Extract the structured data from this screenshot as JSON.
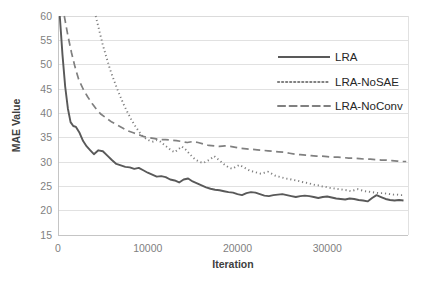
{
  "chart_data": {
    "type": "line",
    "title": "",
    "xlabel": "Iteration",
    "ylabel": "MAE Value",
    "xlim": [
      0,
      39000
    ],
    "ylim": [
      15,
      60
    ],
    "xticks": [
      0,
      10000,
      20000,
      30000
    ],
    "xtick_labels": [
      "0",
      "10000",
      "20000",
      "30000"
    ],
    "yticks": [
      15,
      20,
      25,
      30,
      35,
      40,
      45,
      50,
      55,
      60
    ],
    "ytick_labels": [
      "15",
      "20",
      "25",
      "30",
      "35",
      "40",
      "45",
      "50",
      "55",
      "60"
    ],
    "grid": "horizontal",
    "legend_position": "upper-right-inside",
    "series": [
      {
        "name": "LRA",
        "style": "solid",
        "color": "#595959",
        "x": [
          200,
          500,
          800,
          1100,
          1400,
          1700,
          2000,
          2400,
          2800,
          3200,
          3600,
          4000,
          4500,
          5000,
          5500,
          6000,
          6500,
          7000,
          7500,
          8000,
          8500,
          9000,
          9500,
          10000,
          10500,
          11000,
          11500,
          12000,
          12500,
          13000,
          13500,
          14000,
          14500,
          15000,
          15500,
          16000,
          16500,
          17000,
          17500,
          18000,
          18500,
          19000,
          19500,
          20000,
          20500,
          21000,
          21500,
          22000,
          22500,
          23000,
          23500,
          24000,
          24500,
          25000,
          25500,
          26000,
          26500,
          27000,
          27500,
          28000,
          28500,
          29000,
          29500,
          30000,
          30500,
          31000,
          31500,
          32000,
          32500,
          33000,
          33500,
          34000,
          34500,
          35000,
          35500,
          36000,
          36500,
          37000,
          37500,
          38000,
          38500
        ],
        "y": [
          60.0,
          52.0,
          45.5,
          41.0,
          38.2,
          37.4,
          37.2,
          36.0,
          34.3,
          33.2,
          32.4,
          31.6,
          32.4,
          32.2,
          31.3,
          30.4,
          29.6,
          29.3,
          29.0,
          28.9,
          28.6,
          28.8,
          28.3,
          27.8,
          27.4,
          27.0,
          27.1,
          26.9,
          26.4,
          26.2,
          25.8,
          26.4,
          26.6,
          26.0,
          25.6,
          25.2,
          24.8,
          24.5,
          24.3,
          24.2,
          24.0,
          23.8,
          23.7,
          23.4,
          23.2,
          23.6,
          23.8,
          23.7,
          23.4,
          23.1,
          23.0,
          23.2,
          23.3,
          23.4,
          23.2,
          23.0,
          22.8,
          23.0,
          23.1,
          23.0,
          22.8,
          22.6,
          22.8,
          22.9,
          22.7,
          22.5,
          22.4,
          22.3,
          22.5,
          22.4,
          22.2,
          22.1,
          21.9,
          22.6,
          23.2,
          22.8,
          22.4,
          22.2,
          22.1,
          22.2,
          22.1
        ]
      },
      {
        "name": "LRA-NoSAE",
        "style": "dotted",
        "color": "#808080",
        "x": [
          4200,
          4600,
          5000,
          5400,
          5800,
          6200,
          6600,
          7000,
          7400,
          7800,
          8200,
          8600,
          9000,
          9400,
          9800,
          10200,
          10600,
          11000,
          11400,
          11800,
          12200,
          12600,
          13000,
          13400,
          13800,
          14200,
          14600,
          15000,
          15400,
          15800,
          16200,
          16600,
          17000,
          17400,
          17800,
          18200,
          18600,
          19000,
          19400,
          19800,
          20200,
          20600,
          21000,
          21400,
          21800,
          22200,
          22600,
          23000,
          23400,
          23800,
          24200,
          24600,
          25000,
          25400,
          25800,
          26200,
          26600,
          27000,
          27400,
          27800,
          28200,
          28600,
          29000,
          29400,
          29800,
          30200,
          30600,
          31000,
          31400,
          31800,
          32200,
          32600,
          33000,
          33400,
          33800,
          34200,
          34600,
          35000,
          35400,
          35800,
          36200,
          36600,
          37000,
          37400,
          37800,
          38200,
          38600
        ],
        "y": [
          60.0,
          57.0,
          54.0,
          51.5,
          49.0,
          47.0,
          45.0,
          43.2,
          41.5,
          40.0,
          38.6,
          37.4,
          36.3,
          35.4,
          34.8,
          34.4,
          34.2,
          34.5,
          34.2,
          33.6,
          33.0,
          32.4,
          32.0,
          32.6,
          33.2,
          32.6,
          31.8,
          31.0,
          30.4,
          30.0,
          29.8,
          30.2,
          30.6,
          31.2,
          30.6,
          30.0,
          29.4,
          28.9,
          28.6,
          29.0,
          29.4,
          29.0,
          28.6,
          28.2,
          28.0,
          27.8,
          27.6,
          27.8,
          28.0,
          27.6,
          27.2,
          27.0,
          26.8,
          26.6,
          26.5,
          26.3,
          26.2,
          26.0,
          25.8,
          25.7,
          25.5,
          25.3,
          25.2,
          25.0,
          24.9,
          24.7,
          24.6,
          24.5,
          24.4,
          24.3,
          24.2,
          24.0,
          24.2,
          24.4,
          24.2,
          24.0,
          23.9,
          23.8,
          23.7,
          23.6,
          23.6,
          23.5,
          23.4,
          23.3,
          23.3,
          23.2,
          23.2
        ]
      },
      {
        "name": "LRA-NoConv",
        "style": "dashed",
        "color": "#808080",
        "x": [
          700,
          1100,
          1500,
          1900,
          2300,
          2800,
          3300,
          3800,
          4300,
          4800,
          5400,
          6000,
          6600,
          7200,
          7800,
          8400,
          9000,
          9600,
          10200,
          10800,
          11400,
          12000,
          12600,
          13200,
          13800,
          14400,
          15000,
          15600,
          16200,
          16800,
          17400,
          18000,
          18600,
          19200,
          19800,
          20400,
          21000,
          21600,
          22200,
          22800,
          23400,
          24000,
          24600,
          25200,
          25800,
          26400,
          27000,
          27600,
          28200,
          28800,
          29400,
          30000,
          30600,
          31200,
          31800,
          32400,
          33000,
          33600,
          34200,
          34800,
          35400,
          36000,
          36600,
          37200,
          37800,
          38400,
          38800
        ],
        "y": [
          60.0,
          56.0,
          52.5,
          49.5,
          47.0,
          45.0,
          43.4,
          42.0,
          40.8,
          39.8,
          39.0,
          38.2,
          37.6,
          37.0,
          36.4,
          36.0,
          35.6,
          35.2,
          35.0,
          34.8,
          34.6,
          34.6,
          34.5,
          34.4,
          34.2,
          34.0,
          34.2,
          34.0,
          33.7,
          33.4,
          33.3,
          33.2,
          33.3,
          33.2,
          33.0,
          32.8,
          32.7,
          32.6,
          32.5,
          32.4,
          32.3,
          32.2,
          32.1,
          32.0,
          31.8,
          31.6,
          31.5,
          31.4,
          31.3,
          31.2,
          31.2,
          31.1,
          31.0,
          31.0,
          30.9,
          30.8,
          30.8,
          30.7,
          30.6,
          30.6,
          30.5,
          30.4,
          30.4,
          30.3,
          30.2,
          30.1,
          30.1
        ]
      }
    ]
  },
  "legend": {
    "items": [
      {
        "label": "LRA"
      },
      {
        "label": "LRA-NoSAE"
      },
      {
        "label": "LRA-NoConv"
      }
    ]
  },
  "colors": {
    "solid_series": "#595959",
    "dotted_series": "#808080",
    "dashed_series": "#808080",
    "gridline": "#d9d9d9",
    "axis": "#bfbfbf",
    "tick_text": "#7f7f7f",
    "axis_title_text": "#404040",
    "legend_text": "#262626",
    "background": "#ffffff"
  }
}
